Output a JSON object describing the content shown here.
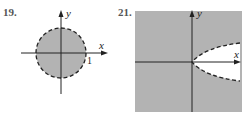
{
  "problems": [
    {
      "number": "19.",
      "x_axis_label": "x",
      "y_axis_label": "y",
      "tick_label": "1",
      "region": "interior of unit circle (dashed boundary, shaded)"
    },
    {
      "number": "21.",
      "x_axis_label": "x",
      "y_axis_label": "y",
      "region": "entire plane shaded except interior of rightward parabola (dashed boundary)"
    }
  ],
  "colors": {
    "shade": "#b3b3b3",
    "axis": "#222222",
    "boundary": "#222222"
  }
}
